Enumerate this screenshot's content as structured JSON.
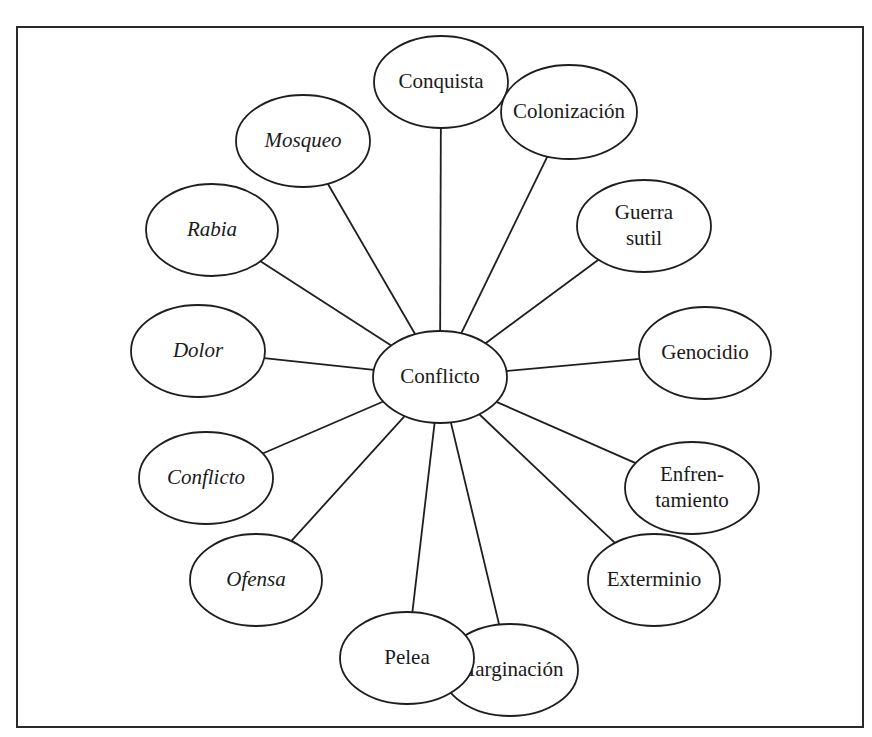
{
  "diagram": {
    "type": "concept-map",
    "colors": {
      "stroke": "#1e1e1e",
      "background": "#ffffff",
      "text": "#1a1a1a"
    },
    "center": {
      "label": "Conflicto",
      "cx": 440,
      "cy": 377,
      "rx": 67,
      "ry": 46,
      "italic": false
    },
    "nodes": [
      {
        "id": "conquista",
        "lines": [
          "Conquista"
        ],
        "cx": 441,
        "cy": 82,
        "rx": 67,
        "ry": 46,
        "italic": false
      },
      {
        "id": "colonizacion",
        "lines": [
          "Colonización"
        ],
        "cx": 569,
        "cy": 112,
        "rx": 68,
        "ry": 47,
        "italic": false
      },
      {
        "id": "guerra-sutil",
        "lines": [
          "Guerra",
          "sutil"
        ],
        "cx": 644,
        "cy": 226,
        "rx": 67,
        "ry": 46,
        "italic": false
      },
      {
        "id": "genocidio",
        "lines": [
          "Genocidio"
        ],
        "cx": 705,
        "cy": 353,
        "rx": 66,
        "ry": 46,
        "italic": false
      },
      {
        "id": "enfrentamiento",
        "lines": [
          "Enfren-",
          "tamiento"
        ],
        "cx": 692,
        "cy": 488,
        "rx": 67,
        "ry": 46,
        "italic": false
      },
      {
        "id": "exterminio",
        "lines": [
          "Exterminio"
        ],
        "cx": 654,
        "cy": 580,
        "rx": 66,
        "ry": 46,
        "italic": false
      },
      {
        "id": "marginacion",
        "lines": [
          "Marginación"
        ],
        "cx": 510,
        "cy": 670,
        "rx": 68,
        "ry": 46,
        "italic": false
      },
      {
        "id": "pelea",
        "lines": [
          "Pelea"
        ],
        "cx": 407,
        "cy": 658,
        "rx": 67,
        "ry": 46,
        "italic": false
      },
      {
        "id": "ofensa",
        "lines": [
          "Ofensa"
        ],
        "cx": 256,
        "cy": 580,
        "rx": 66,
        "ry": 46,
        "italic": true
      },
      {
        "id": "conflicto-italic",
        "lines": [
          "Conflicto"
        ],
        "cx": 206,
        "cy": 478,
        "rx": 67,
        "ry": 46,
        "italic": true
      },
      {
        "id": "dolor",
        "lines": [
          "Dolor"
        ],
        "cx": 198,
        "cy": 351,
        "rx": 67,
        "ry": 46,
        "italic": true
      },
      {
        "id": "rabia",
        "lines": [
          "Rabia"
        ],
        "cx": 212,
        "cy": 230,
        "rx": 66,
        "ry": 46,
        "italic": true
      },
      {
        "id": "mosqueo",
        "lines": [
          "Mosqueo"
        ],
        "cx": 303,
        "cy": 141,
        "rx": 67,
        "ry": 46,
        "italic": true
      }
    ]
  }
}
